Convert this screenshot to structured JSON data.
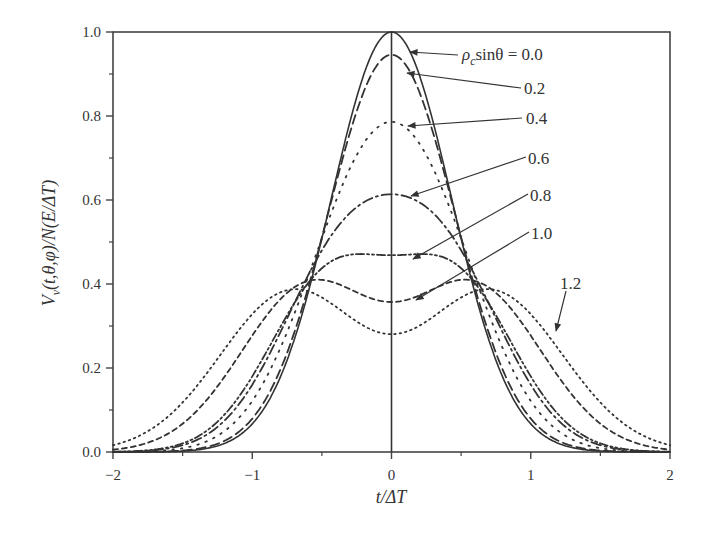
{
  "chart_data": {
    "type": "line",
    "title": "",
    "xlabel": "t/ΔT",
    "ylabel": "V_v(t,θ,φ)/N(E/ΔT)",
    "xlim": [
      -2,
      2
    ],
    "ylim": [
      0.0,
      1.0
    ],
    "x_ticks": [
      "-2",
      "-1",
      "0",
      "1",
      "2"
    ],
    "x_tick_values": [
      -2,
      -1,
      0,
      1,
      2
    ],
    "y_ticks": [
      "0.0",
      "0.2",
      "0.4",
      "0.6",
      "0.8",
      "1.0"
    ],
    "y_tick_values": [
      0,
      0.2,
      0.4,
      0.6,
      0.8,
      1.0
    ],
    "grid": false,
    "legend": "inline annotations with arrows",
    "annotation_prefix": "ρ",
    "annotation_sub": "c",
    "annotation_mid": "sinθ = ",
    "series": [
      {
        "name": "0.0",
        "label": "0.0",
        "style": "solid",
        "A": 0.5,
        "a": 0.0,
        "s": 0.43,
        "center_value": 1.0
      },
      {
        "name": "0.2",
        "label": "0.2",
        "style": "long-dash",
        "A": 0.495,
        "a": 0.13,
        "s": 0.43,
        "center_value": 0.945
      },
      {
        "name": "0.4",
        "label": "0.4",
        "style": "dot",
        "A": 0.468,
        "a": 0.26,
        "s": 0.44,
        "center_value": 0.786
      },
      {
        "name": "0.6",
        "label": "0.6",
        "style": "dash-dot",
        "A": 0.437,
        "a": 0.37,
        "s": 0.44,
        "center_value": 0.612
      },
      {
        "name": "0.8",
        "label": "0.8",
        "style": "dash-dot-dot",
        "A": 0.405,
        "a": 0.45,
        "s": 0.43,
        "center_value": 0.465
      },
      {
        "name": "1.0",
        "label": "1.0",
        "style": "short-dash",
        "A": 0.39,
        "a": 0.6,
        "s": 0.48,
        "center_value": 0.357
      },
      {
        "name": "1.2",
        "label": "1.2",
        "style": "fine-dot",
        "A": 0.38,
        "a": 0.72,
        "s": 0.51,
        "center_value": 0.286
      }
    ],
    "model": "V(t) = A*[exp(-(t-a)^2/(2s^2)) + exp(-(t+a)^2/(2s^2))]",
    "annotations": [
      {
        "text": "0.0",
        "label_x": 462,
        "label_y": 60,
        "tip_x": 410,
        "tip_y": 52,
        "from_x": 458,
        "from_y": 55
      },
      {
        "text": "0.2",
        "label_x": 524,
        "label_y": 94,
        "tip_x": 407,
        "tip_y": 73,
        "from_x": 521,
        "from_y": 88
      },
      {
        "text": "0.4",
        "label_x": 526,
        "label_y": 124,
        "tip_x": 408,
        "tip_y": 126,
        "from_x": 522,
        "from_y": 118
      },
      {
        "text": "0.6",
        "label_x": 528,
        "label_y": 164,
        "tip_x": 411,
        "tip_y": 196,
        "from_x": 526,
        "from_y": 157
      },
      {
        "text": "0.8",
        "label_x": 530,
        "label_y": 201,
        "tip_x": 413,
        "tip_y": 259,
        "from_x": 528,
        "from_y": 194
      },
      {
        "text": "1.0",
        "label_x": 531,
        "label_y": 239,
        "tip_x": 416,
        "tip_y": 300,
        "from_x": 529,
        "from_y": 232
      },
      {
        "text": "1.2",
        "label_x": 560,
        "label_y": 289,
        "tip_x": 556,
        "tip_y": 331,
        "from_x": 566,
        "from_y": 291
      }
    ]
  },
  "axes": {
    "x_title": "t/ΔT",
    "y_title_main": "V",
    "y_title_sub": "v",
    "y_title_rest": "(t,θ,φ)/N(E/ΔT)"
  }
}
